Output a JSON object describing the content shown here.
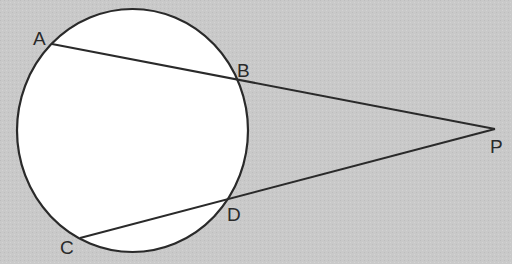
{
  "diagram": {
    "type": "geometry",
    "colors": {
      "background": "#c9c9c9",
      "circle_fill": "#ffffff",
      "stroke": "#2a2a2a"
    },
    "circle": {
      "cx": 132.5,
      "cy": 130.5,
      "rx": 115.5,
      "ry": 121.5
    },
    "points": [
      {
        "id": "A",
        "label": "A",
        "x": 52,
        "y": 44,
        "lx": 33,
        "ly": 45
      },
      {
        "id": "B",
        "label": "B",
        "x": 240,
        "y": 82,
        "lx": 237,
        "ly": 77
      },
      {
        "id": "C",
        "label": "C",
        "x": 80,
        "y": 238,
        "lx": 60,
        "ly": 254
      },
      {
        "id": "D",
        "label": "D",
        "x": 229,
        "y": 199,
        "lx": 227,
        "ly": 221
      },
      {
        "id": "P",
        "label": "P",
        "x": 495,
        "y": 129,
        "lx": 490,
        "ly": 153
      }
    ],
    "segments": [
      {
        "from": "A",
        "to": "P",
        "name": "secant-APB"
      },
      {
        "from": "C",
        "to": "P",
        "name": "secant-CDP"
      }
    ]
  }
}
